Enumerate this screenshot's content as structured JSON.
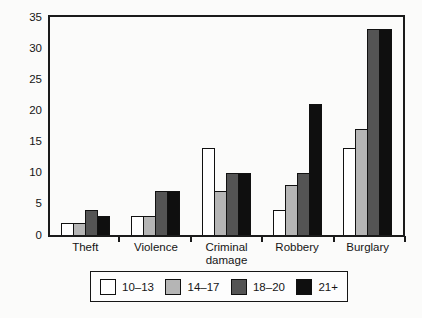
{
  "chart_data": {
    "type": "bar",
    "title": "",
    "xlabel": "",
    "ylabel": "",
    "categories": [
      "Theft",
      "Violence",
      "Criminal damage",
      "Robbery",
      "Burglary"
    ],
    "series": [
      {
        "name": "10–13",
        "color": "#ffffff",
        "values": [
          2,
          3,
          14,
          4,
          14
        ]
      },
      {
        "name": "14–17",
        "color": "#b5b5b5",
        "values": [
          2,
          3,
          7,
          8,
          17
        ]
      },
      {
        "name": "18–20",
        "color": "#545454",
        "values": [
          4,
          7,
          10,
          10,
          33
        ]
      },
      {
        "name": "21+",
        "color": "#0f0f0f",
        "values": [
          3,
          7,
          10,
          21,
          33
        ]
      }
    ],
    "ylim": [
      0,
      35
    ],
    "yticks": [
      0,
      5,
      10,
      15,
      20,
      25,
      30,
      35
    ],
    "grid": false,
    "frame": true,
    "legend_position": "bottom",
    "legend_entries": [
      "10–13",
      "14–17",
      "18–20",
      "21+"
    ]
  },
  "colors": {
    "axis": "#1a1a1a",
    "background": "#fbfbfa"
  }
}
